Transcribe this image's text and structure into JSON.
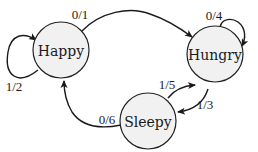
{
  "diagram": {
    "type": "state-machine",
    "colors": {
      "node_fill": "#f1f1f1",
      "node_stroke": "#222222",
      "edge": "#1a1a1a",
      "text": "#1a1a1a"
    },
    "states": [
      {
        "id": "happy",
        "label": "Happy"
      },
      {
        "id": "hungry",
        "label": "Hungry"
      },
      {
        "id": "sleepy",
        "label": "Sleepy"
      }
    ],
    "transitions": [
      {
        "from": "happy",
        "to": "happy",
        "label": "1/2"
      },
      {
        "from": "happy",
        "to": "hungry",
        "label": "0/1"
      },
      {
        "from": "hungry",
        "to": "hungry",
        "label": "0/4"
      },
      {
        "from": "hungry",
        "to": "sleepy",
        "label": "1/3"
      },
      {
        "from": "sleepy",
        "to": "hungry",
        "label": "1/5"
      },
      {
        "from": "sleepy",
        "to": "happy",
        "label": "0/6"
      }
    ]
  }
}
